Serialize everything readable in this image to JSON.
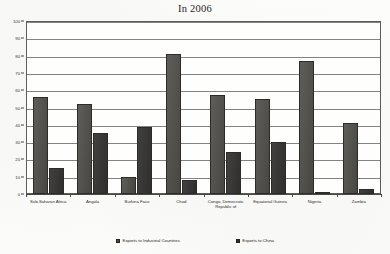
{
  "chart_data": {
    "type": "bar",
    "title": "In 2006",
    "xlabel": "",
    "ylabel": "",
    "ylim": [
      0,
      100
    ],
    "yticks": [
      0,
      10,
      20,
      30,
      40,
      50,
      60,
      70,
      80,
      90,
      100
    ],
    "grid": true,
    "legend_position": "bottom",
    "categories": [
      "Sub-Saharan Africa",
      "Angola",
      "Burkina Faso",
      "Chad",
      "Congo, Democratic Republic of",
      "Equatorial Guinea",
      "Nigeria",
      "Zambia"
    ],
    "series": [
      {
        "name": "Exports to Industrial Countries",
        "color": "#4c4b47",
        "values": [
          56,
          52,
          10,
          81,
          57,
          55,
          77,
          41
        ]
      },
      {
        "name": "Exports to China",
        "color": "#333230",
        "values": [
          15,
          35,
          39,
          8,
          24,
          30,
          1,
          3
        ]
      }
    ]
  },
  "legend": {
    "entries": [
      {
        "label": "Exports to Industrial Countries"
      },
      {
        "label": "Exports to China"
      }
    ]
  }
}
